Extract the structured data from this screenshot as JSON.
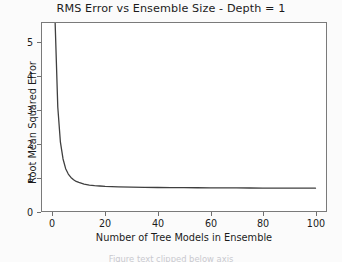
{
  "figure": {
    "background_color": "#fbfbfb",
    "plot_background_color": "#ffffff",
    "spine_color": "#7a7a7a"
  },
  "chart_data": {
    "type": "line",
    "title": "RMS Error vs Ensemble Size - Depth = 1",
    "xlabel": "Number of Tree Models in Ensemble",
    "ylabel": "Root Mean Squared Error",
    "xlim": [
      -4,
      104
    ],
    "ylim": [
      0,
      5.6
    ],
    "xticks": [
      0,
      20,
      40,
      60,
      80,
      100
    ],
    "yticks": [
      0,
      1,
      2,
      3,
      4,
      5
    ],
    "xtick_labels": [
      "0",
      "20",
      "40",
      "60",
      "80",
      "100"
    ],
    "ytick_labels": [
      "0",
      "1",
      "2",
      "3",
      "4",
      "5"
    ],
    "grid": false,
    "legend": false,
    "line_color": "#3f3f3f",
    "line_width": 1.3,
    "series": [
      {
        "name": "RMSE",
        "x": [
          1,
          2,
          3,
          4,
          5,
          6,
          7,
          8,
          9,
          10,
          12,
          14,
          16,
          18,
          20,
          25,
          30,
          35,
          40,
          45,
          50,
          55,
          60,
          65,
          70,
          75,
          80,
          85,
          90,
          95,
          100
        ],
        "y": [
          5.6,
          3.1,
          2.05,
          1.55,
          1.26,
          1.1,
          1.0,
          0.93,
          0.88,
          0.85,
          0.8,
          0.77,
          0.755,
          0.745,
          0.735,
          0.72,
          0.71,
          0.705,
          0.7,
          0.697,
          0.694,
          0.692,
          0.69,
          0.688,
          0.686,
          0.685,
          0.684,
          0.683,
          0.682,
          0.681,
          0.68
        ]
      }
    ],
    "asymptote_value": 0.68,
    "note_clipped_top": "curve exits top of axes near x = 1"
  },
  "clipped_caption": "Figure text clipped below axis"
}
